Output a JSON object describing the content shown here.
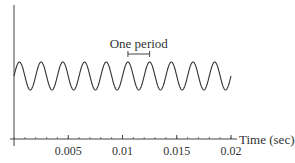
{
  "chart_data": {
    "type": "line",
    "title": "",
    "xlabel": "Time (sec)",
    "ylabel": "",
    "xlim": [
      0,
      0.02
    ],
    "x_ticks": [
      0.005,
      0.01,
      0.015,
      0.02
    ],
    "x_tick_labels": [
      "0.005",
      "0.01",
      "0.015",
      "0.02"
    ],
    "minor_tick_step": 0.001,
    "series": [
      {
        "name": "sine wave",
        "function": "sin",
        "frequency_hz": 500,
        "period_sec": 0.002,
        "cycles_shown": 10,
        "amplitude": 1,
        "phase": 0,
        "x_range": [
          0,
          0.02
        ]
      }
    ],
    "annotations": [
      {
        "text": "One period",
        "bracket_from": 0.0105,
        "bracket_to": 0.0125
      }
    ],
    "grid": false,
    "legend": null
  }
}
